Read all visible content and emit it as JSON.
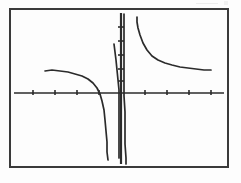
{
  "image": {
    "kind": "scanned-graph-figure",
    "width": 241,
    "height": 183,
    "background_color": "#fdfdfd",
    "ink_color": "#2b2b2b",
    "frame": {
      "name": "plot-border",
      "x": 10,
      "y": 9,
      "width": 218,
      "height": 158,
      "stroke_color": "#3a3a3a",
      "stroke_width": 2
    }
  },
  "chart_data": {
    "type": "line",
    "title": "",
    "subtitle": "",
    "xlabel": "",
    "ylabel": "",
    "grid": false,
    "legend": null,
    "axes": {
      "x_axis": {
        "name": "x-axis",
        "y_pixel": 93,
        "x_start": 14,
        "x_end": 224,
        "tick_count_left": 4,
        "tick_count_right": 4,
        "tick_length": 5,
        "tick_labels": []
      },
      "y_axis": {
        "name": "y-axis",
        "x_pixel": 121,
        "y_start": 13,
        "y_end": 164,
        "tick_count_above": 5,
        "tick_count_below": 0,
        "tick_length": 5,
        "tick_labels": []
      },
      "origin_pixel": [
        121,
        93
      ],
      "xlim": [
        -8,
        8
      ],
      "ylim": [
        -6,
        6
      ]
    },
    "annotations": [],
    "series": [
      {
        "name": "upper-right-branch",
        "description": "decaying hyperbolic branch in the first quadrant approaching a horizontal asymptote",
        "points": [
          [
            137,
            17
          ],
          [
            137,
            22
          ],
          [
            138,
            28
          ],
          [
            140,
            35
          ],
          [
            143,
            43
          ],
          [
            147,
            50
          ],
          [
            152,
            56
          ],
          [
            158,
            60
          ],
          [
            165,
            63
          ],
          [
            172,
            65
          ],
          [
            180,
            67
          ],
          [
            188,
            68
          ],
          [
            196,
            69
          ],
          [
            204,
            70
          ],
          [
            211,
            70
          ]
        ]
      },
      {
        "name": "left-branch",
        "description": "slowly rising branch entering from the left, flattening then plunging down near the vertical asymptote",
        "points": [
          [
            45,
            71
          ],
          [
            52,
            70
          ],
          [
            60,
            71
          ],
          [
            68,
            72
          ],
          [
            75,
            74
          ],
          [
            82,
            76
          ],
          [
            88,
            79
          ],
          [
            93,
            83
          ],
          [
            97,
            88
          ],
          [
            100,
            94
          ],
          [
            102,
            101
          ],
          [
            104,
            110
          ],
          [
            105,
            120
          ],
          [
            106,
            131
          ],
          [
            107,
            142
          ],
          [
            107,
            152
          ],
          [
            108,
            160
          ]
        ]
      },
      {
        "name": "vertical-asymptote-left",
        "description": "near-vertical ink stroke just left of the y-axis extending above and below the x-axis",
        "points": [
          [
            114,
            44
          ],
          [
            115,
            52
          ],
          [
            116,
            60
          ],
          [
            117,
            70
          ],
          [
            118,
            80
          ],
          [
            119,
            90
          ],
          [
            119,
            100
          ],
          [
            119,
            112
          ],
          [
            119,
            124
          ],
          [
            119,
            136
          ],
          [
            119,
            148
          ],
          [
            119,
            158
          ]
        ]
      },
      {
        "name": "vertical-asymptote-right",
        "description": "second near-vertical ink stroke just right of the y-axis running from top to bottom of the frame",
        "points": [
          [
            124,
            14
          ],
          [
            124,
            30
          ],
          [
            124,
            48
          ],
          [
            124,
            66
          ],
          [
            124,
            84
          ],
          [
            124,
            96
          ],
          [
            125,
            112
          ],
          [
            125,
            128
          ],
          [
            125,
            144
          ],
          [
            126,
            158
          ],
          [
            126,
            164
          ]
        ]
      }
    ]
  }
}
